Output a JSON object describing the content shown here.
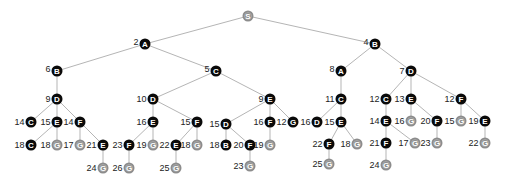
{
  "diagram": {
    "type": "search-tree",
    "colors": {
      "expanded": "#0a0a0a",
      "goal_or_frontier": "#8c8c8c",
      "edge": "#b5b5b5"
    },
    "nodes": [
      {
        "id": "n0",
        "letter": "S",
        "cost": "",
        "x": 248,
        "y": 16,
        "kind": "gray",
        "parent": null
      },
      {
        "id": "n1",
        "letter": "A",
        "cost": "2",
        "x": 145,
        "y": 44,
        "kind": "black",
        "parent": "n0"
      },
      {
        "id": "n2",
        "letter": "B",
        "cost": "4",
        "x": 375,
        "y": 44,
        "kind": "black",
        "parent": "n0"
      },
      {
        "id": "n3",
        "letter": "B",
        "cost": "6",
        "x": 57,
        "y": 71,
        "kind": "black",
        "parent": "n1"
      },
      {
        "id": "n4",
        "letter": "C",
        "cost": "5",
        "x": 216,
        "y": 71,
        "kind": "black",
        "parent": "n1"
      },
      {
        "id": "n5",
        "letter": "A",
        "cost": "8",
        "x": 341,
        "y": 71,
        "kind": "black",
        "parent": "n2"
      },
      {
        "id": "n6",
        "letter": "D",
        "cost": "7",
        "x": 411,
        "y": 71,
        "kind": "black",
        "parent": "n2"
      },
      {
        "id": "n7",
        "letter": "D",
        "cost": "9",
        "x": 57,
        "y": 99,
        "kind": "black",
        "parent": "n3"
      },
      {
        "id": "n8",
        "letter": "D",
        "cost": "10",
        "x": 153,
        "y": 99,
        "kind": "black",
        "parent": "n4"
      },
      {
        "id": "n9",
        "letter": "E",
        "cost": "9",
        "x": 270,
        "y": 99,
        "kind": "black",
        "parent": "n4"
      },
      {
        "id": "n10",
        "letter": "C",
        "cost": "11",
        "x": 341,
        "y": 99,
        "kind": "black",
        "parent": "n5"
      },
      {
        "id": "n11",
        "letter": "C",
        "cost": "12",
        "x": 386,
        "y": 99,
        "kind": "black",
        "parent": "n6"
      },
      {
        "id": "n12",
        "letter": "E",
        "cost": "13",
        "x": 411,
        "y": 99,
        "kind": "black",
        "parent": "n6"
      },
      {
        "id": "n13",
        "letter": "F",
        "cost": "12",
        "x": 461,
        "y": 99,
        "kind": "black",
        "parent": "n6"
      },
      {
        "id": "n14",
        "letter": "C",
        "cost": "14",
        "x": 31,
        "y": 122,
        "kind": "black",
        "parent": "n7"
      },
      {
        "id": "n15",
        "letter": "E",
        "cost": "15",
        "x": 57,
        "y": 122,
        "kind": "black",
        "parent": "n7"
      },
      {
        "id": "n16",
        "letter": "F",
        "cost": "14",
        "x": 80,
        "y": 122,
        "kind": "black",
        "parent": "n7"
      },
      {
        "id": "n17",
        "letter": "E",
        "cost": "16",
        "x": 153,
        "y": 122,
        "kind": "black",
        "parent": "n8"
      },
      {
        "id": "n18",
        "letter": "F",
        "cost": "15",
        "x": 197,
        "y": 122,
        "kind": "black",
        "parent": "n8"
      },
      {
        "id": "n19",
        "letter": "D",
        "cost": "15",
        "x": 226,
        "y": 124,
        "kind": "black",
        "parent": "n9"
      },
      {
        "id": "n20",
        "letter": "F",
        "cost": "16",
        "x": 270,
        "y": 122,
        "kind": "black",
        "parent": "n9"
      },
      {
        "id": "n21",
        "letter": "G",
        "cost": "12",
        "x": 293,
        "y": 122,
        "kind": "black",
        "parent": "n9"
      },
      {
        "id": "n22",
        "letter": "D",
        "cost": "16",
        "x": 317,
        "y": 122,
        "kind": "black",
        "parent": "n10"
      },
      {
        "id": "n23",
        "letter": "E",
        "cost": "15",
        "x": 341,
        "y": 122,
        "kind": "black",
        "parent": "n10"
      },
      {
        "id": "n24",
        "letter": "E",
        "cost": "14",
        "x": 386,
        "y": 121,
        "kind": "black",
        "parent": "n11"
      },
      {
        "id": "n25",
        "letter": "G",
        "cost": "16",
        "x": 411,
        "y": 121,
        "kind": "gray",
        "parent": "n12"
      },
      {
        "id": "n26",
        "letter": "F",
        "cost": "20",
        "x": 437,
        "y": 121,
        "kind": "black",
        "parent": "n12"
      },
      {
        "id": "n27",
        "letter": "G",
        "cost": "15",
        "x": 461,
        "y": 121,
        "kind": "gray",
        "parent": "n13"
      },
      {
        "id": "n28",
        "letter": "E",
        "cost": "19",
        "x": 485,
        "y": 121,
        "kind": "black",
        "parent": "n13"
      },
      {
        "id": "n29",
        "letter": "C",
        "cost": "18",
        "x": 31,
        "y": 145,
        "kind": "black",
        "parent": "n15"
      },
      {
        "id": "n30",
        "letter": "G",
        "cost": "18",
        "x": 57,
        "y": 145,
        "kind": "gray",
        "parent": "n15"
      },
      {
        "id": "n31",
        "letter": "G",
        "cost": "17",
        "x": 80,
        "y": 145,
        "kind": "gray",
        "parent": "n16"
      },
      {
        "id": "n32",
        "letter": "E",
        "cost": "21",
        "x": 103,
        "y": 145,
        "kind": "black",
        "parent": "n16"
      },
      {
        "id": "n33",
        "letter": "F",
        "cost": "23",
        "x": 129,
        "y": 145,
        "kind": "black",
        "parent": "n17"
      },
      {
        "id": "n34",
        "letter": "G",
        "cost": "19",
        "x": 153,
        "y": 145,
        "kind": "gray",
        "parent": "n17"
      },
      {
        "id": "n35",
        "letter": "E",
        "cost": "22",
        "x": 176,
        "y": 145,
        "kind": "black",
        "parent": "n18"
      },
      {
        "id": "n36",
        "letter": "G",
        "cost": "18",
        "x": 197,
        "y": 145,
        "kind": "gray",
        "parent": "n18"
      },
      {
        "id": "n37",
        "letter": "B",
        "cost": "18",
        "x": 226,
        "y": 145,
        "kind": "black",
        "parent": "n19"
      },
      {
        "id": "n38",
        "letter": "F",
        "cost": "20",
        "x": 250,
        "y": 145,
        "kind": "black",
        "parent": "n19"
      },
      {
        "id": "n39",
        "letter": "G",
        "cost": "19",
        "x": 270,
        "y": 145,
        "kind": "gray",
        "parent": "n20"
      },
      {
        "id": "n40",
        "letter": "F",
        "cost": "22",
        "x": 329,
        "y": 144,
        "kind": "black",
        "parent": "n23"
      },
      {
        "id": "n41",
        "letter": "G",
        "cost": "18",
        "x": 357,
        "y": 144,
        "kind": "gray",
        "parent": "n23"
      },
      {
        "id": "n42",
        "letter": "F",
        "cost": "21",
        "x": 386,
        "y": 143,
        "kind": "black",
        "parent": "n24"
      },
      {
        "id": "n43",
        "letter": "G",
        "cost": "17",
        "x": 415,
        "y": 143,
        "kind": "gray",
        "parent": "n24"
      },
      {
        "id": "n44",
        "letter": "G",
        "cost": "23",
        "x": 437,
        "y": 143,
        "kind": "gray",
        "parent": "n26"
      },
      {
        "id": "n45",
        "letter": "G",
        "cost": "22",
        "x": 485,
        "y": 143,
        "kind": "gray",
        "parent": "n28"
      },
      {
        "id": "n46",
        "letter": "G",
        "cost": "24",
        "x": 103,
        "y": 168,
        "kind": "gray",
        "parent": "n32"
      },
      {
        "id": "n47",
        "letter": "G",
        "cost": "26",
        "x": 129,
        "y": 168,
        "kind": "gray",
        "parent": "n33"
      },
      {
        "id": "n48",
        "letter": "G",
        "cost": "25",
        "x": 176,
        "y": 168,
        "kind": "gray",
        "parent": "n35"
      },
      {
        "id": "n49",
        "letter": "G",
        "cost": "23",
        "x": 250,
        "y": 166,
        "kind": "gray",
        "parent": "n38"
      },
      {
        "id": "n50",
        "letter": "G",
        "cost": "25",
        "x": 329,
        "y": 164,
        "kind": "gray",
        "parent": "n40"
      },
      {
        "id": "n51",
        "letter": "G",
        "cost": "24",
        "x": 386,
        "y": 165,
        "kind": "gray",
        "parent": "n42"
      }
    ]
  }
}
